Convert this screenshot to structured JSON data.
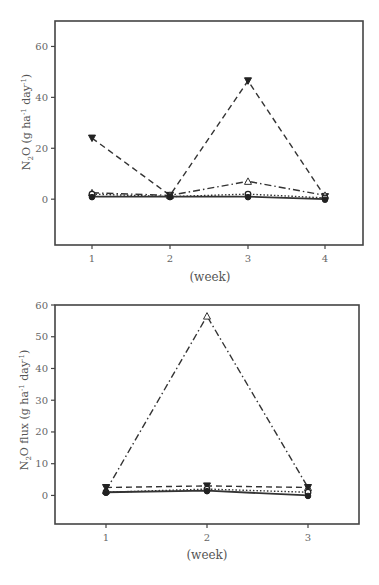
{
  "chart_data": [
    {
      "type": "line",
      "title": "",
      "xlabel": "(week)",
      "ylabel": "N2O (g ha-1 day-1)",
      "ylabel_parts": {
        "main": "N",
        "sub": "2",
        "rest": "O (g ha",
        "sup1": "-1",
        "mid": " day",
        "sup2": "-1",
        "end": ")"
      },
      "x": [
        1,
        2,
        3,
        4
      ],
      "x_ticks": [
        "1",
        "2",
        "3",
        "4"
      ],
      "y_ticks": [
        "0",
        "20",
        "40",
        "60"
      ],
      "ylim": [
        -18,
        70
      ],
      "grid": false,
      "legend": "none",
      "series": [
        {
          "name": "filled-down-triangle-dashed",
          "marker": "down-triangle-filled",
          "line": "dashed",
          "values": [
            24,
            1.5,
            46.5,
            1
          ]
        },
        {
          "name": "open-triangle-dashdot",
          "marker": "triangle-open",
          "line": "dashdot",
          "values": [
            2.5,
            1.5,
            7,
            1.5
          ]
        },
        {
          "name": "open-circle-dotted",
          "marker": "circle-open",
          "line": "dotted",
          "values": [
            2,
            1,
            2,
            0.5
          ]
        },
        {
          "name": "filled-circle-solid",
          "marker": "circle-filled",
          "line": "solid",
          "values": [
            1,
            1,
            1,
            0
          ]
        }
      ]
    },
    {
      "type": "line",
      "title": "",
      "xlabel": "(week)",
      "ylabel": "N2O flux (g ha-1 day-1)",
      "ylabel_parts": {
        "main": "N",
        "sub": "2",
        "rest": "O flux (g ha",
        "sup1": "-1",
        "mid": " day",
        "sup2": "-1",
        "end": ")"
      },
      "x": [
        1,
        2,
        3
      ],
      "x_ticks": [
        "1",
        "2",
        "3"
      ],
      "y_ticks": [
        "0",
        "10",
        "20",
        "30",
        "40",
        "50",
        "60"
      ],
      "ylim": [
        -9,
        60
      ],
      "grid": false,
      "legend": "none",
      "series": [
        {
          "name": "open-triangle-dashdot",
          "marker": "triangle-open",
          "line": "dashdot",
          "values": [
            1.5,
            56.5,
            2.5
          ]
        },
        {
          "name": "filled-down-triangle-dashed",
          "marker": "down-triangle-filled",
          "line": "dashed",
          "values": [
            2.5,
            3,
            2.5
          ]
        },
        {
          "name": "open-circle-dotted",
          "marker": "circle-open",
          "line": "dotted",
          "values": [
            1,
            2,
            1
          ]
        },
        {
          "name": "filled-circle-solid",
          "marker": "circle-filled",
          "line": "solid",
          "values": [
            1,
            1.5,
            0
          ]
        }
      ]
    }
  ]
}
